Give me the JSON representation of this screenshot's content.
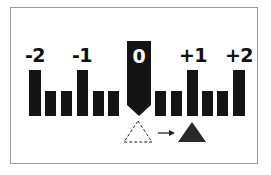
{
  "diagram": {
    "type": "exposure-compensation-scale",
    "colors": {
      "bar": "#141414",
      "marker": "#141414",
      "marker_text": "#ffffff",
      "frame_border": "#9a9a9a",
      "background": "#ffffff"
    },
    "scale": {
      "labels": [
        {
          "text": "-2",
          "value": -2
        },
        {
          "text": "-1",
          "value": -1
        },
        {
          "text": "0",
          "value": 0
        },
        {
          "text": "+1",
          "value": 1
        },
        {
          "text": "+2",
          "value": 2
        }
      ],
      "step": "1/3",
      "ticks": [
        {
          "value": "-2",
          "kind": "major"
        },
        {
          "value": "-5/3",
          "kind": "minor"
        },
        {
          "value": "-4/3",
          "kind": "minor"
        },
        {
          "value": "-1",
          "kind": "major"
        },
        {
          "value": "-2/3",
          "kind": "minor"
        },
        {
          "value": "-1/3",
          "kind": "minor"
        },
        {
          "value": "0",
          "kind": "current-marker"
        },
        {
          "value": "+1/3",
          "kind": "minor"
        },
        {
          "value": "+2/3",
          "kind": "minor"
        },
        {
          "value": "+1",
          "kind": "major"
        },
        {
          "value": "+4/3",
          "kind": "minor"
        },
        {
          "value": "+5/3",
          "kind": "minor"
        },
        {
          "value": "+2",
          "kind": "major"
        }
      ]
    },
    "current_value_label": "0",
    "indicator": {
      "from": "dashed-outline-triangle",
      "arrow": "right-arrow",
      "to": "filled-triangle"
    }
  }
}
